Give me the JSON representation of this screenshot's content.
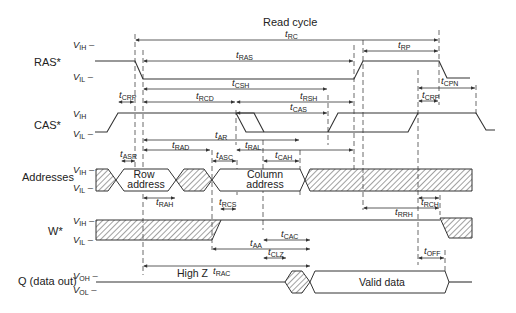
{
  "title": "Read cycle",
  "signals": {
    "ras": {
      "label": "RAS*",
      "high": "V",
      "high_sub": "IH",
      "low": "V",
      "low_sub": "IL"
    },
    "cas": {
      "label": "CAS*",
      "high": "V",
      "high_sub": "IH",
      "low": "V",
      "low_sub": "IL"
    },
    "addr": {
      "label": "Addresses",
      "high": "V",
      "high_sub": "IH",
      "low": "V",
      "low_sub": "IL",
      "row": [
        "Row",
        "address"
      ],
      "col": [
        "Column",
        "address"
      ]
    },
    "we": {
      "label": "W*",
      "high": "V",
      "high_sub": "IH",
      "low": "V",
      "low_sub": "IL"
    },
    "q": {
      "label": "Q (data out)",
      "high": "V",
      "high_sub": "OH",
      "low": "V",
      "low_sub": "OL",
      "highz": "High Z",
      "valid": "Valid data"
    }
  },
  "timing": {
    "rc": "RC",
    "ras": "RAS",
    "rp": "RP",
    "csh": "CSH",
    "cpn": "CPN",
    "crp1": "CRP",
    "crp2": "CRP",
    "rcd": "RCD",
    "rsh": "RSH",
    "cas": "CAS",
    "ar": "AR",
    "rad": "RAD",
    "ral": "RAL",
    "asr": "ASR",
    "asc": "ASC",
    "cah": "CAH",
    "rah": "RAH",
    "rcs": "RCS",
    "rch": "RCH",
    "rrh": "RRH",
    "cac": "CAC",
    "aa": "AA",
    "clz": "CLZ",
    "rac": "RAC",
    "off": "OFF"
  },
  "t_prefix": "t"
}
